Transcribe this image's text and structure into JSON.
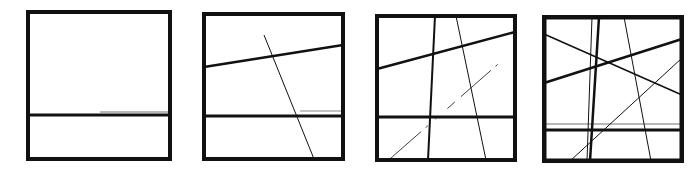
{
  "figure": {
    "ink_color": "#111111",
    "background": "#ffffff"
  },
  "panels": [
    {
      "id": "panel-1",
      "frame": {
        "x": 26,
        "y": 10,
        "w": 146,
        "h": 151,
        "stroke": 4
      },
      "lines": [
        {
          "x1": 28,
          "y1": 115,
          "x2": 170,
          "y2": 115,
          "w": 3,
          "kind": "thick-horizontal"
        },
        {
          "x1": 100,
          "y1": 112,
          "x2": 168,
          "y2": 112,
          "w": 1,
          "kind": "thin-horizontal",
          "opacity": 0.6
        }
      ]
    },
    {
      "id": "panel-2",
      "frame": {
        "x": 202,
        "y": 12,
        "w": 143,
        "h": 149,
        "stroke": 4
      },
      "lines": [
        {
          "x1": 204,
          "y1": 67,
          "x2": 343,
          "y2": 45,
          "w": 2.5,
          "kind": "thick-slant"
        },
        {
          "x1": 204,
          "y1": 116,
          "x2": 343,
          "y2": 116,
          "w": 3,
          "kind": "thick-horizontal"
        },
        {
          "x1": 264,
          "y1": 35,
          "x2": 314,
          "y2": 159,
          "w": 1,
          "kind": "thin-diagonal"
        },
        {
          "x1": 300,
          "y1": 111,
          "x2": 343,
          "y2": 111,
          "w": 1,
          "kind": "thin-horizontal",
          "opacity": 0.5
        }
      ]
    },
    {
      "id": "panel-3",
      "frame": {
        "x": 375,
        "y": 14,
        "w": 142,
        "h": 148,
        "stroke": 4
      },
      "lines": [
        {
          "x1": 377,
          "y1": 69,
          "x2": 515,
          "y2": 32,
          "w": 2.5,
          "kind": "thick-slant"
        },
        {
          "x1": 377,
          "y1": 117,
          "x2": 515,
          "y2": 117,
          "w": 3,
          "kind": "thick-horizontal"
        },
        {
          "x1": 435,
          "y1": 16,
          "x2": 428,
          "y2": 160,
          "w": 2,
          "kind": "medium-vertical"
        },
        {
          "x1": 456,
          "y1": 16,
          "x2": 486,
          "y2": 160,
          "w": 1,
          "kind": "thin-diagonal"
        },
        {
          "x1": 391,
          "y1": 158,
          "x2": 505,
          "y2": 58,
          "w": 0.8,
          "kind": "thin-dashed-diagonal",
          "dash": "40 6 3 10 2 14 10 8"
        }
      ]
    },
    {
      "id": "panel-4",
      "frame": {
        "x": 542,
        "y": 15,
        "w": 142,
        "h": 148,
        "stroke": 4.5
      },
      "lines": [
        {
          "x1": 544,
          "y1": 83,
          "x2": 682,
          "y2": 39,
          "w": 2.5,
          "kind": "thick-slant"
        },
        {
          "x1": 544,
          "y1": 34,
          "x2": 682,
          "y2": 95,
          "w": 1.5,
          "kind": "medium-slant"
        },
        {
          "x1": 544,
          "y1": 130,
          "x2": 682,
          "y2": 130,
          "w": 3,
          "kind": "thick-horizontal"
        },
        {
          "x1": 544,
          "y1": 124,
          "x2": 682,
          "y2": 124,
          "w": 1,
          "kind": "thin-horizontal",
          "opacity": 0.6
        },
        {
          "x1": 592,
          "y1": 17,
          "x2": 587,
          "y2": 161,
          "w": 1,
          "kind": "thin-vertical"
        },
        {
          "x1": 599,
          "y1": 17,
          "x2": 590,
          "y2": 161,
          "w": 2.5,
          "kind": "thick-vertical"
        },
        {
          "x1": 624,
          "y1": 17,
          "x2": 651,
          "y2": 161,
          "w": 1,
          "kind": "thin-diagonal"
        },
        {
          "x1": 570,
          "y1": 161,
          "x2": 682,
          "y2": 58,
          "w": 1,
          "kind": "thin-diagonal-rising"
        }
      ]
    }
  ]
}
